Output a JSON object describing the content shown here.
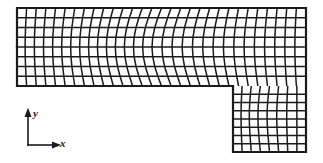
{
  "figure": {
    "background_color": "#ffffff",
    "line_color": "#1a1a1a",
    "cell_fill_color": "#ffffff"
  },
  "axes_indicator": {
    "name": "coordinate-axes-triad",
    "x_label": "x",
    "y_label": "y",
    "origin_x": 28,
    "origin_y": 145,
    "x_arrow_length": 28,
    "y_arrow_length": 32,
    "arrow_head_size": 4.5,
    "stroke_width": 1.6
  },
  "mesh": {
    "type": "quadrilateral-structured",
    "regions": [
      {
        "name": "top-horizontal-arm",
        "x_min": 17,
        "x_max": 306,
        "y_min": 8,
        "y_max": 86,
        "columns": 30,
        "rows": 8,
        "distortion": "vertical grid lines skew progressively toward the re-entrant step, strongest near the middle-right",
        "max_skew_px": 9.5
      },
      {
        "name": "bottom-right-leg",
        "x_min": 233,
        "x_max": 306,
        "y_min": 86,
        "y_max": 152,
        "columns": 8,
        "rows": 8,
        "distortion": "mild shear increasing toward the upper-left re-entrant corner",
        "max_skew_px": 3.0
      }
    ],
    "outline": {
      "stroke_width": 2.2,
      "points": [
        [
          17,
          8
        ],
        [
          306,
          8
        ],
        [
          306,
          152
        ],
        [
          233,
          152
        ],
        [
          233,
          86
        ],
        [
          17,
          86
        ]
      ]
    },
    "interior_stroke_width": 1.5,
    "total_elements": 304
  },
  "chart_data": {
    "type": "diagram",
    "xlabel": "x",
    "ylabel": "y",
    "annotations": []
  }
}
